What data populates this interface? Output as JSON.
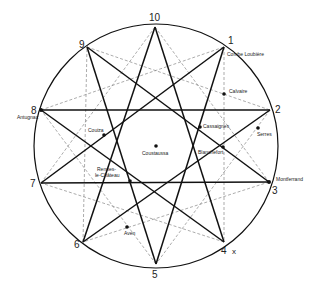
{
  "diagram": {
    "title": "",
    "circle": {
      "cx": 156,
      "cy": 146,
      "r": 122
    },
    "points": [
      {
        "id": "1",
        "label": "1",
        "x": 224,
        "y": 47,
        "lx": 228,
        "ly": 44
      },
      {
        "id": "2",
        "label": "2",
        "x": 270,
        "y": 110,
        "lx": 275,
        "ly": 113
      },
      {
        "id": "3",
        "label": "3",
        "x": 269,
        "y": 182,
        "lx": 272,
        "ly": 194
      },
      {
        "id": "4",
        "label": "4",
        "x": 224,
        "y": 242,
        "lx": 221,
        "ly": 254
      },
      {
        "id": "5",
        "label": "5",
        "x": 156,
        "y": 264,
        "lx": 152,
        "ly": 278
      },
      {
        "id": "6",
        "label": "6",
        "x": 83,
        "y": 242,
        "lx": 74,
        "ly": 248
      },
      {
        "id": "7",
        "label": "7",
        "x": 41,
        "y": 183,
        "lx": 30,
        "ly": 187
      },
      {
        "id": "8",
        "label": "8",
        "x": 41,
        "y": 110,
        "lx": 31,
        "ly": 114
      },
      {
        "id": "9",
        "label": "9",
        "x": 87,
        "y": 47,
        "lx": 79,
        "ly": 48
      },
      {
        "id": "10",
        "label": "10",
        "x": 155,
        "y": 27,
        "lx": 149,
        "ly": 21
      }
    ],
    "extra_mark": {
      "label": "x",
      "x": 232,
      "y": 254
    },
    "solid_edges": [
      [
        "10",
        "4"
      ],
      [
        "10",
        "6"
      ],
      [
        "9",
        "3"
      ],
      [
        "9",
        "5"
      ],
      [
        "1",
        "5"
      ],
      [
        "1",
        "7"
      ],
      [
        "8",
        "2"
      ],
      [
        "7",
        "3"
      ],
      [
        "2",
        "6"
      ],
      [
        "8",
        "4"
      ]
    ],
    "dashed_edges": [
      [
        "10",
        "3"
      ],
      [
        "3",
        "6"
      ],
      [
        "6",
        "9"
      ],
      [
        "9",
        "2"
      ],
      [
        "2",
        "5"
      ],
      [
        "5",
        "8"
      ],
      [
        "8",
        "1"
      ],
      [
        "1",
        "4"
      ],
      [
        "4",
        "7"
      ],
      [
        "7",
        "10"
      ]
    ],
    "places": [
      {
        "name": "Combe Loubière",
        "dot": false,
        "x": 224,
        "y": 47,
        "tx": 227,
        "ty": 56
      },
      {
        "name": "Calvaire",
        "dot": true,
        "x": 224,
        "y": 94,
        "tx": 229,
        "ty": 93
      },
      {
        "name": "Serres",
        "dot": true,
        "x": 258,
        "y": 128,
        "tx": 257,
        "ty": 136
      },
      {
        "name": "Montferrand",
        "dot": false,
        "x": 269,
        "y": 182,
        "tx": 276,
        "ty": 181
      },
      {
        "name": "Cassaignes",
        "dot": true,
        "x": 200,
        "y": 127,
        "tx": 203,
        "ty": 128
      },
      {
        "name": "Blanchefort",
        "dot": true,
        "x": 223,
        "y": 147,
        "tx": 198,
        "ty": 154
      },
      {
        "name": "Coustaussa",
        "dot": true,
        "x": 156,
        "y": 146,
        "tx": 142,
        "ty": 155
      },
      {
        "name": "Couiza",
        "dot": true,
        "x": 104,
        "y": 135,
        "tx": 88,
        "ty": 132
      },
      {
        "name": "Rennes-",
        "dot": false,
        "x": 0,
        "y": 0,
        "tx": 97,
        "ty": 171
      },
      {
        "name": "le-Château",
        "dot": true,
        "x": 130,
        "y": 181,
        "tx": 95,
        "ty": 177
      },
      {
        "name": "Aven",
        "dot": true,
        "x": 127,
        "y": 227,
        "tx": 124,
        "ty": 235
      },
      {
        "name": "Antugnac",
        "dot": false,
        "x": 41,
        "y": 110,
        "tx": 17,
        "ty": 119
      }
    ]
  }
}
